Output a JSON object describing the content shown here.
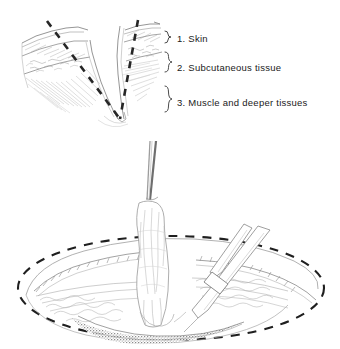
{
  "figure": {
    "background_color": "#ffffff",
    "ink_color": "#2a2a2a",
    "tissue_line_color": "#9a9a9a",
    "shadow_color": "#6e6e6e",
    "dash_color": "#1f1f1f"
  },
  "legend": {
    "items": [
      {
        "number": "1.",
        "label": "1. Skin",
        "brace": "}"
      },
      {
        "number": "2.",
        "label": "2. Subcutaneous tissue",
        "brace": "}"
      },
      {
        "number": "3.",
        "label": "3. Muscle and deeper tissues",
        "brace": "}"
      }
    ]
  },
  "upper_panel": {
    "name": "v-shaped-wound-cross-section",
    "description": "V-shaped wound cross section with dashed excision lines through skin, subcutaneous tissue and muscle"
  },
  "lower_panel": {
    "name": "elliptical-open-wound",
    "description": "Open elliptical wound with dashed excision outline, forceps elevating devitalized tissue and scissors excising it"
  }
}
